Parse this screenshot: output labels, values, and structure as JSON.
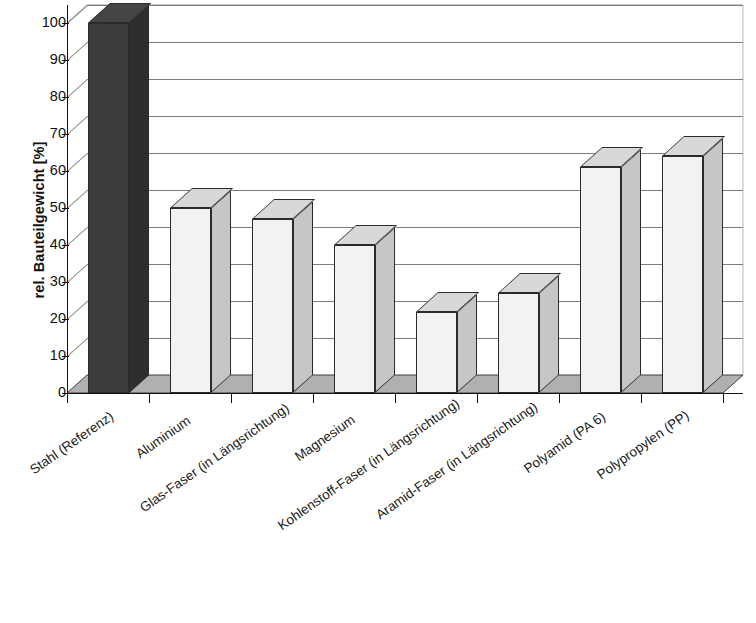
{
  "chart_data": {
    "type": "bar",
    "title": "",
    "subtitle": "",
    "xlabel": "",
    "ylabel": "rel. Bauteilgewicht [%]",
    "ylim": [
      0,
      100
    ],
    "ytick_step": 10,
    "grid": true,
    "legend": false,
    "legend_position": "none",
    "three_d": true,
    "categories": [
      "Stahl (Referenz)",
      "Aluminium",
      "Glas-Faser (in Längsrichtung)",
      "Magnesium",
      "Kohlenstoff-Faser (in Längsrichtung)",
      "Aramid-Faser (in Längsrichtung)",
      "Polyamid (PA 6)",
      "Polypropylen (PP)"
    ],
    "values": [
      100,
      50,
      47,
      40,
      22,
      27,
      61,
      64
    ],
    "ytick_labels": [
      "0",
      "10",
      "20",
      "30",
      "40",
      "50",
      "60",
      "70",
      "80",
      "90",
      "100"
    ],
    "bar_colors": [
      "#3b3b3b",
      "#f2f2f2",
      "#f2f2f2",
      "#f2f2f2",
      "#f2f2f2",
      "#f2f2f2",
      "#f2f2f2",
      "#f2f2f2"
    ],
    "bar_side_colors": [
      "#2e2e2e",
      "#c6c6c6",
      "#c6c6c6",
      "#c6c6c6",
      "#c6c6c6",
      "#c6c6c6",
      "#c6c6c6",
      "#c6c6c6"
    ],
    "bar_top_colors": [
      "#454545",
      "#d8d8d8",
      "#d8d8d8",
      "#d8d8d8",
      "#d8d8d8",
      "#d8d8d8",
      "#d8d8d8",
      "#d8d8d8"
    ],
    "floor_color": "#b0b0b0",
    "grid_color": "#7d7d7d",
    "axis_color": "#111111",
    "background_color": "#ffffff"
  },
  "axis": {
    "y_title": "rel. Bauteilgewicht [%]"
  }
}
